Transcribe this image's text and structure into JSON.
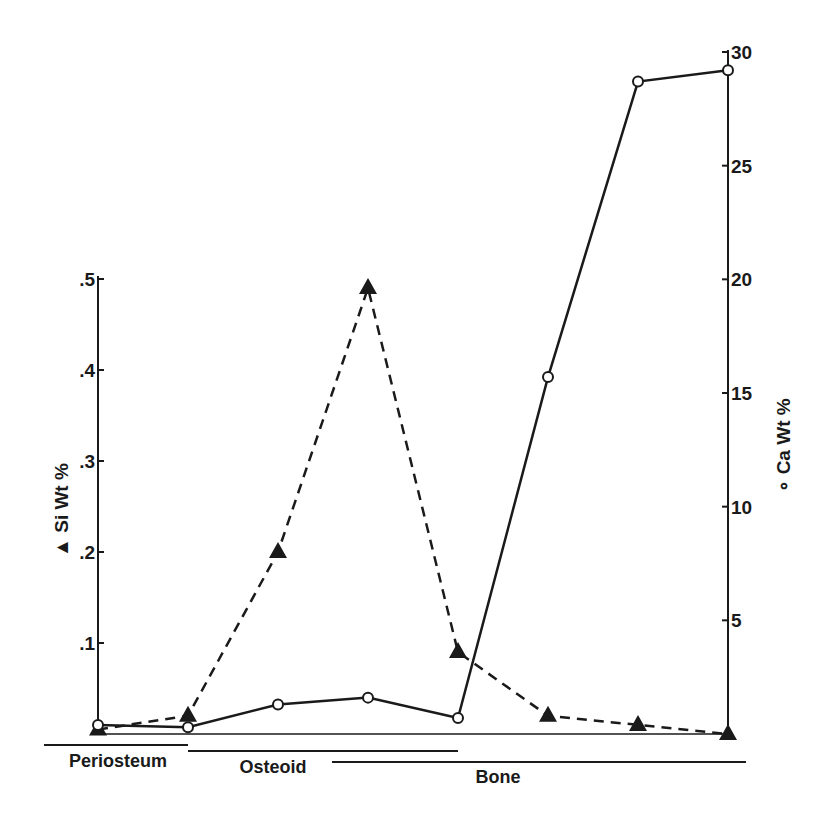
{
  "chart_data": {
    "type": "line",
    "title": "",
    "x": [
      1,
      2,
      3,
      4,
      5,
      6,
      7,
      8
    ],
    "xlabel": "",
    "series": [
      {
        "name": "Si Wt %",
        "marker": "filled-triangle",
        "line_style": "dashed",
        "axis": "left",
        "values": [
          0.005,
          0.02,
          0.2,
          0.49,
          0.09,
          0.02,
          0.01,
          0.0
        ]
      },
      {
        "name": "Ca Wt %",
        "marker": "open-circle",
        "line_style": "solid",
        "axis": "right",
        "values": [
          0.4,
          0.3,
          1.3,
          1.6,
          0.7,
          15.7,
          28.7,
          29.2
        ]
      }
    ],
    "left_axis": {
      "label": "▲ Si Wt %",
      "ylim": [
        0,
        0.5
      ],
      "ticks": [
        ".1",
        ".2",
        ".3",
        ".4",
        ".5"
      ]
    },
    "right_axis": {
      "label": "∘ Ca Wt %",
      "ylim": [
        0,
        30
      ],
      "ticks": [
        "5",
        "10",
        "15",
        "20",
        "25",
        "30"
      ]
    },
    "regions": [
      {
        "label": "Periosteum",
        "from": 0.4,
        "to": 2.0
      },
      {
        "label": "Osteoid",
        "from": 2.0,
        "to": 5.0
      },
      {
        "label": "Bone",
        "from": 3.6,
        "to": 8.2
      }
    ],
    "grid": false,
    "legend": "axis labels"
  },
  "labels": {
    "left_axis_title": "▲ Si Wt %",
    "right_axis_title": "∘ Ca Wt %",
    "periosteum": "Periosteum",
    "osteoid": "Osteoid",
    "bone": "Bone"
  }
}
